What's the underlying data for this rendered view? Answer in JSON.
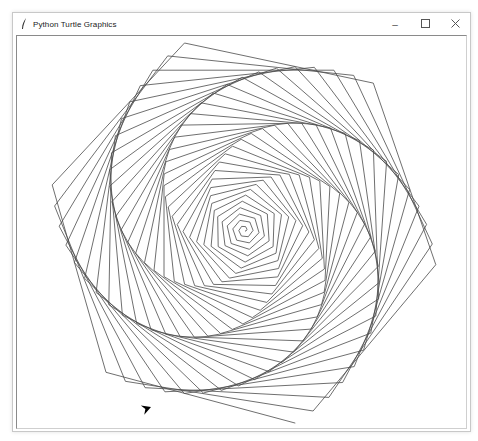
{
  "window": {
    "title": "Python Turtle Graphics",
    "controls": {
      "minimize_glyph": "–",
      "maximize_glyph": "☐",
      "close_glyph": "✕"
    }
  },
  "canvas": {
    "background": "#ffffff",
    "pen_color": "#4a4a4a",
    "pen_width": 0.8,
    "turtle_shape": "arrow",
    "turtle_color": "#000000"
  },
  "drawing": {
    "pattern": "hexagonal-square-spiral",
    "center_x": 228,
    "center_y": 195,
    "steps": 196,
    "step_increment": 1,
    "turn_angle_deg": 59,
    "start_heading_deg": 0
  },
  "turtle": {
    "x": 134,
    "y": 371,
    "heading_deg": 20
  }
}
